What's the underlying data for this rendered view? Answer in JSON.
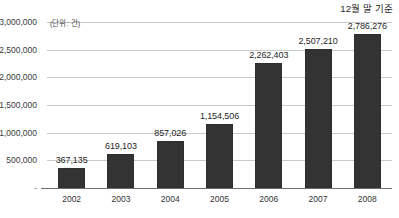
{
  "annotation_top_right": "12월 말 기준",
  "unit_label": "(단위: 건)",
  "zero_tick": "-",
  "chart_data": {
    "type": "bar",
    "title": "",
    "subtitle": "",
    "annotation": "12월 말 기준",
    "unit": "(단위: 건)",
    "xlabel": "",
    "ylabel": "",
    "categories": [
      "2002",
      "2003",
      "2004",
      "2005",
      "2006",
      "2007",
      "2008"
    ],
    "values": [
      367135,
      619103,
      857026,
      1154506,
      2262403,
      2507210,
      2786276
    ],
    "value_labels": [
      "367,135",
      "619,103",
      "857,026",
      "1,154,506",
      "2,262,403",
      "2,507,210",
      "2,786,276"
    ],
    "ylim": [
      0,
      3000000
    ],
    "ytick_values": [
      0,
      500000,
      1000000,
      1500000,
      2000000,
      2500000,
      3000000
    ],
    "ytick_labels": [
      "-",
      "500,000",
      "1,000,000",
      "1,500,000",
      "2,000,000",
      "2,500,000",
      "3,000,000"
    ],
    "grid": true,
    "legend": "none",
    "bar_color": "#333333",
    "gridline_color": "#c9c9c9",
    "axis_color": "#6e6e6e",
    "background": "#ffffff"
  }
}
